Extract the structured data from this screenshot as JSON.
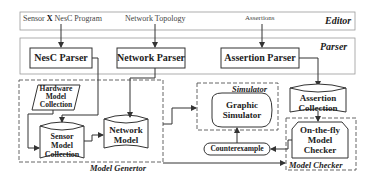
{
  "diagram": {
    "editor": {
      "label": "Editor",
      "inputs": {
        "sensor_program_prefix": "Sensor",
        "sensor_program_x": "X",
        "sensor_program_suffix": "NesC Program",
        "network_topology": "Network Topology",
        "assertions": "Assertions"
      }
    },
    "parser": {
      "label": "Parser",
      "nesc_parser": "NesC Parser",
      "network_parser": "Network Parser",
      "assertion_parser": "Assertion Parser"
    },
    "model_generator": {
      "label": "Model Genertor",
      "hardware_model_collection": [
        "Hardware",
        "Model",
        "Collection"
      ],
      "sensor_model_collection": [
        "Sensor",
        "Model",
        "Collection"
      ],
      "network_model": [
        "Network",
        "Model"
      ]
    },
    "simulator": {
      "label": "Simulator",
      "graphic_simulator": [
        "Graphic",
        "Simulator"
      ]
    },
    "assertion_collection": [
      "Assertion",
      "Collection"
    ],
    "counterexample": "Counterexample",
    "model_checker": {
      "label": "Model Checker",
      "on_the_fly": [
        "On-the-fly",
        "Model",
        "Checker"
      ]
    }
  }
}
